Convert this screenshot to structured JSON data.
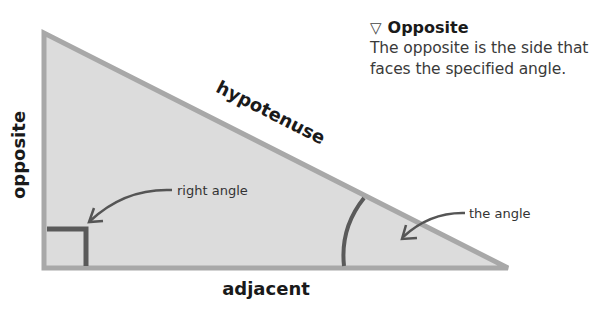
{
  "diagram": {
    "labels": {
      "opposite": "opposite",
      "hypotenuse": "hypotenuse",
      "adjacent": "adjacent"
    },
    "callouts": {
      "right_angle": "right angle",
      "the_angle": "the angle"
    },
    "colors": {
      "fill": "#dcdcdc",
      "stroke": "#a8a8a8",
      "marker": "#5a5a5a"
    }
  },
  "info": {
    "icon": "down-triangle-icon",
    "icon_glyph": "▽",
    "title": "Opposite",
    "text_line1": "The opposite is the side that",
    "text_line2": "faces the specified angle."
  }
}
